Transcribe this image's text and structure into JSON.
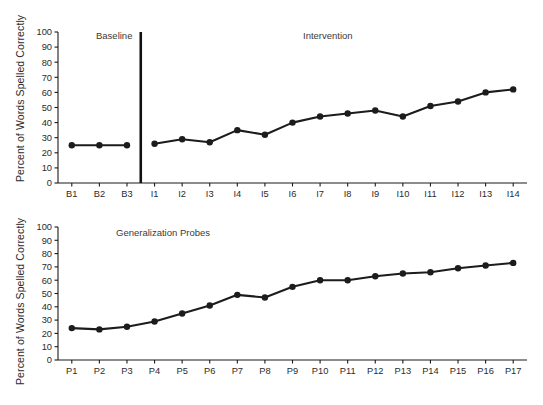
{
  "figure": {
    "background_color": "#ffffff",
    "ink_color": "#1c1c1c"
  },
  "panels": [
    {
      "id": "top",
      "ylabel": "Percent of Words Spelled Correctly",
      "phase_labels": [
        {
          "name": "baseline-phase-label",
          "text": "Baseline"
        },
        {
          "name": "intervention-phase-label",
          "text": "Intervention"
        }
      ]
    },
    {
      "id": "bottom",
      "ylabel": "Percent of Words Spelled Correctly",
      "phase_labels": [
        {
          "name": "generalization-phase-label",
          "text": "Generalization Probes"
        }
      ]
    }
  ],
  "chart_data": [
    {
      "type": "line",
      "title": "",
      "panel": "top",
      "xlabel": "",
      "ylabel": "Percent of Words Spelled Correctly",
      "ylim": [
        0,
        100
      ],
      "ytick_labels": [
        "0",
        "10",
        "20",
        "30",
        "40",
        "50",
        "60",
        "70",
        "80",
        "90",
        "100"
      ],
      "yticks": [
        0,
        10,
        20,
        30,
        40,
        50,
        60,
        70,
        80,
        90,
        100
      ],
      "grid": false,
      "legend_position": "none",
      "phase_change_after_category": "B3",
      "annotations": [
        "Baseline",
        "Intervention"
      ],
      "categories": [
        "B1",
        "B2",
        "B3",
        "I1",
        "I2",
        "I3",
        "I4",
        "I5",
        "I6",
        "I7",
        "I8",
        "I9",
        "I10",
        "I11",
        "I12",
        "I13",
        "I14"
      ],
      "series": [
        {
          "name": "Baseline",
          "categories": [
            "B1",
            "B2",
            "B3"
          ],
          "values": [
            25,
            25,
            25
          ]
        },
        {
          "name": "Intervention",
          "categories": [
            "I1",
            "I2",
            "I3",
            "I4",
            "I5",
            "I6",
            "I7",
            "I8",
            "I9",
            "I10",
            "I11",
            "I12",
            "I13",
            "I14"
          ],
          "values": [
            26,
            29,
            27,
            35,
            32,
            40,
            44,
            46,
            48,
            44,
            51,
            54,
            60,
            62
          ]
        }
      ]
    },
    {
      "type": "line",
      "title": "",
      "panel": "bottom",
      "xlabel": "",
      "ylabel": "Percent of Words Spelled Correctly",
      "ylim": [
        0,
        100
      ],
      "ytick_labels": [
        "0",
        "10",
        "20",
        "30",
        "40",
        "50",
        "60",
        "70",
        "80",
        "90",
        "100"
      ],
      "yticks": [
        0,
        10,
        20,
        30,
        40,
        50,
        60,
        70,
        80,
        90,
        100
      ],
      "grid": false,
      "legend_position": "none",
      "annotations": [
        "Generalization Probes"
      ],
      "categories": [
        "P1",
        "P2",
        "P3",
        "P4",
        "P5",
        "P6",
        "P7",
        "P8",
        "P9",
        "P10",
        "P11",
        "P12",
        "P13",
        "P14",
        "P15",
        "P16",
        "P17"
      ],
      "series": [
        {
          "name": "Generalization Probes",
          "categories": [
            "P1",
            "P2",
            "P3",
            "P4",
            "P5",
            "P6",
            "P7",
            "P8",
            "P9",
            "P10",
            "P11",
            "P12",
            "P13",
            "P14",
            "P15",
            "P16",
            "P17"
          ],
          "values": [
            24,
            23,
            25,
            29,
            35,
            41,
            49,
            47,
            55,
            60,
            60,
            63,
            65,
            66,
            69,
            71,
            73
          ]
        }
      ]
    }
  ]
}
